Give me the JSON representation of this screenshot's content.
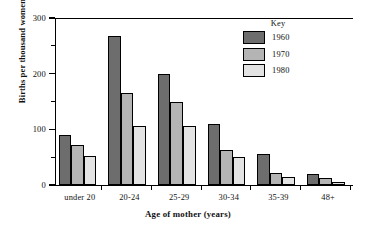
{
  "chart_data": {
    "type": "bar",
    "title": "",
    "subtitle": "",
    "xlabel": "Age of mother (years)",
    "ylabel": "Births per thousand women",
    "categories": [
      "under 20",
      "20-24",
      "25-29",
      "30-34",
      "35-39",
      "48+"
    ],
    "series": [
      {
        "name": "1960",
        "color": "#6d6d6d",
        "values": [
          89,
          267,
          200,
          110,
          55,
          20
        ]
      },
      {
        "name": "1970",
        "color": "#b4b4b4",
        "values": [
          72,
          165,
          150,
          63,
          22,
          13
        ]
      },
      {
        "name": "1980",
        "color": "#e3e3e3",
        "values": [
          52,
          106,
          106,
          50,
          15,
          5
        ]
      }
    ],
    "ylim": [
      0,
      300
    ],
    "yticks_major": [
      0,
      100,
      200,
      300
    ],
    "yticks_minor": [
      50,
      150,
      250
    ],
    "ytick_labels": [
      "0",
      "100",
      "200",
      "300"
    ],
    "grid": false,
    "legend": {
      "title": "Key",
      "position": "inside-top-right",
      "entries": [
        "1960",
        "1970",
        "1980"
      ]
    }
  },
  "colors": {
    "axis": "#000000",
    "background": "#ffffff",
    "series_1960": "#6d6d6d",
    "series_1970": "#b4b4b4",
    "series_1980": "#e3e3e3"
  }
}
